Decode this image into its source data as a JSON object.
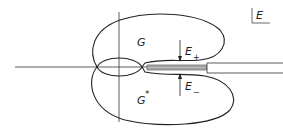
{
  "diagram": {
    "plane_label": "E",
    "region_upper": "G",
    "region_lower": "G",
    "region_lower_sup": "*",
    "edge_upper": "E",
    "edge_upper_sub": "+",
    "edge_lower": "E",
    "edge_lower_sub": "−"
  },
  "colors": {
    "stroke": "#222222",
    "background": "#ffffff"
  }
}
